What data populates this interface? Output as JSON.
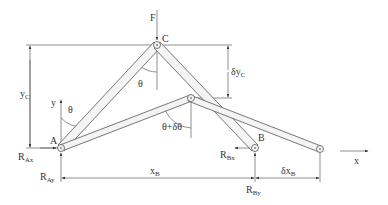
{
  "diagram": {
    "type": "mechanism-virtual-work",
    "labels": {
      "force": "F",
      "point_c": "C",
      "point_a": "A",
      "point_b": "B",
      "theta": "θ",
      "theta_delta": "θ+δθ",
      "y_axis": "y",
      "x_axis": "x",
      "yc": "y",
      "yc_sub": "C",
      "delta_yc": "δy",
      "delta_yc_sub": "C",
      "xb": "x",
      "xb_sub": "B",
      "delta_xb": "δx",
      "delta_xb_sub": "B",
      "rax": "R",
      "rax_sub": "Ax",
      "ray": "R",
      "ray_sub": "Ay",
      "rbx": "R",
      "rbx_sub": "Bx",
      "rby": "R",
      "rby_sub": "By"
    },
    "colors": {
      "line": "#444444",
      "link_fill": "#f4f4f4",
      "text": "#333333"
    }
  }
}
